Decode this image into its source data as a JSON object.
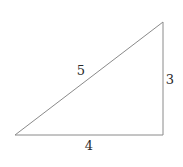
{
  "diagram": {
    "type": "right-triangle",
    "stroke_color": "#8a8a8a",
    "label_color": "#2a2a2a",
    "vertices": {
      "left": [
        15,
        135
      ],
      "top_right": [
        163,
        22
      ],
      "bottom_right": [
        163,
        135
      ]
    },
    "sides": {
      "hypotenuse": {
        "label": "5",
        "pos": [
          81,
          70
        ]
      },
      "base": {
        "label": "4",
        "pos": [
          89,
          145
        ]
      },
      "height": {
        "label": "3",
        "pos": [
          170,
          79
        ]
      }
    }
  }
}
